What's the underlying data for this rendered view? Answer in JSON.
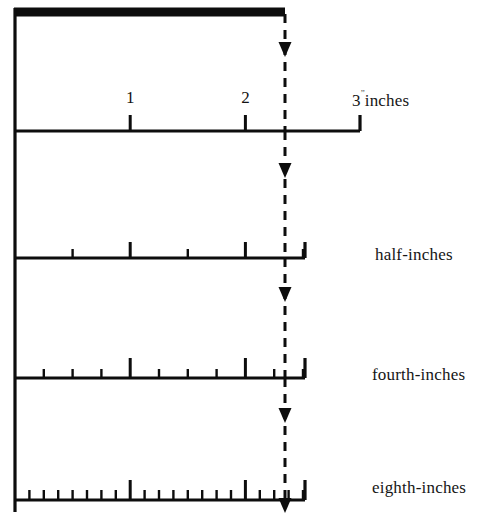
{
  "figure": {
    "type": "ruler-subdivision-diagram",
    "background_color": "#ffffff",
    "ink_color": "#0d0d0d"
  },
  "geometry": {
    "origin_x": 15,
    "inch_px": 115.2,
    "dashed_line_x": 285,
    "top_bar": {
      "x1": 14,
      "x2": 285,
      "y": 12,
      "thickness": 9
    },
    "left_rail_x": 15,
    "left_rail_y1": 8,
    "left_rail_y2": 512
  },
  "rulers": [
    {
      "id": "inches",
      "label": "3",
      "label_suffix": "inches",
      "inch_mark": "”",
      "baseline_y": 131,
      "end_x": 360,
      "divisions_per_inch": 1,
      "major_tick_height": 16,
      "minor_tick_height": 0,
      "numbered_ticks": [
        {
          "value": "1",
          "inch": 1
        },
        {
          "value": "2",
          "inch": 2
        }
      ],
      "label_x": 352,
      "label_y": 91,
      "total_inches": 3
    },
    {
      "id": "half-inches",
      "label": "half-inches",
      "baseline_y": 258,
      "end_x": 305,
      "divisions_per_inch": 2,
      "major_tick_height": 16,
      "minor_tick_height": 9,
      "label_x": 375,
      "label_y": 245,
      "total_inches": 2.5
    },
    {
      "id": "fourth-inches",
      "label": "fourth-inches",
      "baseline_y": 378,
      "end_x": 305,
      "divisions_per_inch": 4,
      "major_tick_height": 20,
      "minor_tick_height": 9,
      "label_x": 372,
      "label_y": 365,
      "total_inches": 2.5
    },
    {
      "id": "eighth-inches",
      "label": "eighth-inches",
      "baseline_y": 500,
      "end_x": 305,
      "divisions_per_inch": 8,
      "major_tick_height": 20,
      "minor_tick_height": 10,
      "label_x": 372,
      "label_y": 478,
      "total_inches": 2.5
    }
  ],
  "dashed_line": {
    "x": 285,
    "dash_pattern": "9 7",
    "segments": [
      {
        "y1": 14,
        "y2": 131
      },
      {
        "y1": 131,
        "y2": 258
      },
      {
        "y1": 258,
        "y2": 378
      },
      {
        "y1": 378,
        "y2": 500
      }
    ],
    "arrows": [
      {
        "x": 285,
        "y": 57
      },
      {
        "x": 285,
        "y": 178
      },
      {
        "x": 285,
        "y": 302
      },
      {
        "x": 285,
        "y": 423
      },
      {
        "x": 285,
        "y": 513
      }
    ],
    "marks_position": "2 3/8 inches"
  },
  "chart_data": {
    "type": "table",
    "columns": [
      "ruler",
      "divisions_per_inch",
      "smallest_unit"
    ],
    "rows": [
      [
        "inches",
        1,
        "1 inch"
      ],
      [
        "half-inches",
        2,
        "1/2 inch"
      ],
      [
        "fourth-inches",
        4,
        "1/4 inch"
      ],
      [
        "eighth-inches",
        8,
        "1/8 inch"
      ]
    ]
  }
}
